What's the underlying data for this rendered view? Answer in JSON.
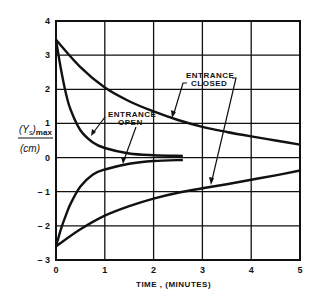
{
  "chart_data": {
    "type": "line",
    "title": "",
    "xlabel": "TIME , (MINUTES)",
    "ylabel": "(Ys)max (cm)",
    "ylabel_top": "(Y",
    "ylabel_sub": "s",
    "ylabel_max": ")max",
    "ylabel_unit": "(cm)",
    "xlim": [
      0,
      5
    ],
    "ylim": [
      -3,
      4
    ],
    "grid": true,
    "x_ticks": [
      "0",
      "1",
      "2",
      "3",
      "4",
      "5"
    ],
    "y_ticks": [
      "4",
      "3",
      "2",
      "1",
      "0",
      "-1",
      "-2",
      "-3"
    ],
    "annotations": [
      {
        "text_line1": "ENTRANCE",
        "text_line2": "OPEN"
      },
      {
        "text_line1": "ENTRANCE",
        "text_line2": "CLOSED"
      }
    ],
    "series": [
      {
        "name": "Entrance open (upper)",
        "x": [
          0,
          0.1,
          0.2,
          0.3,
          0.5,
          0.75,
          1.0,
          1.5,
          2.0,
          2.6
        ],
        "values": [
          3.45,
          2.6,
          1.9,
          1.4,
          0.8,
          0.45,
          0.28,
          0.12,
          0.07,
          0.05
        ]
      },
      {
        "name": "Entrance open (lower)",
        "x": [
          0,
          0.1,
          0.2,
          0.3,
          0.5,
          0.75,
          1.0,
          1.5,
          2.0,
          2.6
        ],
        "values": [
          -2.6,
          -2.1,
          -1.7,
          -1.35,
          -0.85,
          -0.5,
          -0.35,
          -0.18,
          -0.1,
          -0.07
        ]
      },
      {
        "name": "Entrance closed (upper)",
        "x": [
          0,
          0.5,
          1.0,
          1.5,
          2.0,
          2.5,
          3.0,
          3.5,
          4.0,
          4.5,
          5.0
        ],
        "values": [
          3.45,
          2.65,
          2.05,
          1.65,
          1.35,
          1.1,
          0.9,
          0.75,
          0.62,
          0.5,
          0.38
        ]
      },
      {
        "name": "Entrance closed (lower)",
        "x": [
          0,
          0.5,
          1.0,
          1.5,
          2.0,
          2.5,
          3.0,
          3.5,
          4.0,
          4.5,
          5.0
        ],
        "values": [
          -2.6,
          -2.1,
          -1.7,
          -1.42,
          -1.2,
          -1.03,
          -0.9,
          -0.78,
          -0.65,
          -0.52,
          -0.38
        ]
      }
    ]
  }
}
